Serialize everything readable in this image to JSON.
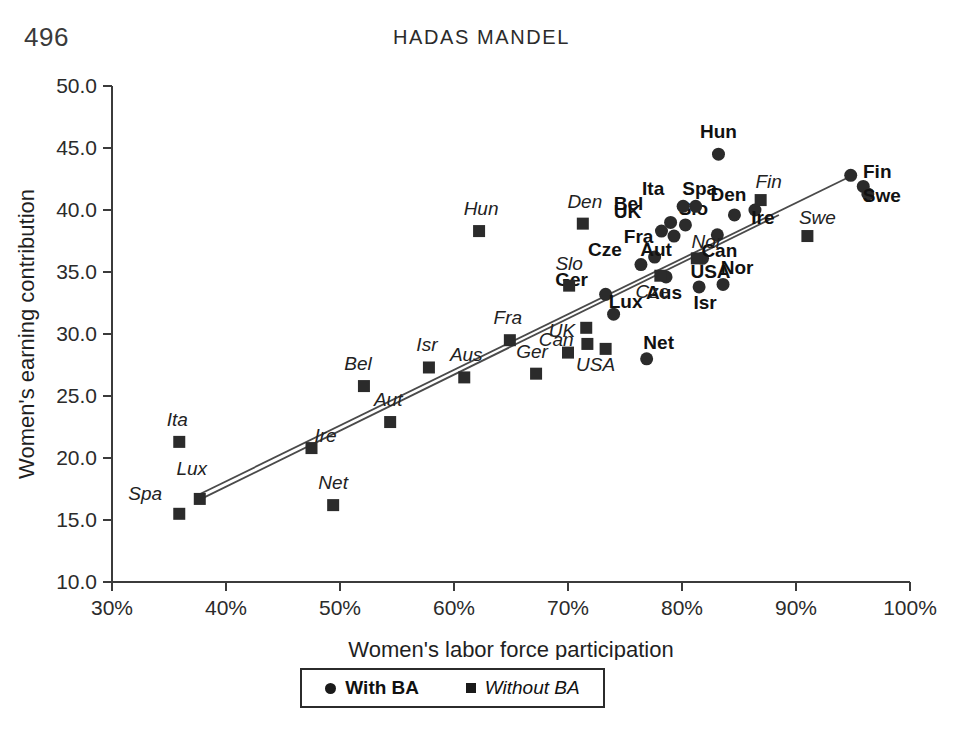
{
  "page": {
    "number": "496",
    "running_head": "HADAS MANDEL"
  },
  "legend": {
    "with_ba": "With BA",
    "without_ba": "Without BA",
    "with_ba_marker": "circle-marker",
    "without_ba_marker": "square-marker"
  },
  "chart_data": {
    "type": "scatter",
    "title": "",
    "xlabel": "Women's labor force participation",
    "ylabel": "Women's earning contribution",
    "xlim": [
      30,
      100
    ],
    "ylim": [
      10.0,
      50.0
    ],
    "xticks": [
      "30%",
      "40%",
      "50%",
      "60%",
      "70%",
      "80%",
      "90%",
      "100%"
    ],
    "xtick_values": [
      30,
      40,
      50,
      60,
      70,
      80,
      90,
      100
    ],
    "yticks": [
      "10.0",
      "15.0",
      "20.0",
      "25.0",
      "30.0",
      "35.0",
      "40.0",
      "45.0",
      "50.0"
    ],
    "ytick_values": [
      10,
      15,
      20,
      25,
      30,
      35,
      40,
      45,
      50
    ],
    "grid": false,
    "legend_position": "bottom-center",
    "series": [
      {
        "name": "With BA",
        "marker": "circle",
        "label_style": "bold",
        "points": [
          {
            "label": "Ger",
            "x": 73.3,
            "y": 33.2,
            "label_dx": -34,
            "label_dy": -8
          },
          {
            "label": "Cze",
            "x": 76.4,
            "y": 35.6,
            "label_dx": -36,
            "label_dy": -9
          },
          {
            "label": "Fra",
            "x": 77.6,
            "y": 36.2,
            "label_dx": -16,
            "label_dy": -14
          },
          {
            "label": "UK",
            "x": 78.2,
            "y": 38.3,
            "label_dx": -34,
            "label_dy": -13
          },
          {
            "label": "Aus",
            "x": 78.6,
            "y": 34.6,
            "label_dx": -2,
            "label_dy": 22
          },
          {
            "label": "Bel",
            "x": 79.0,
            "y": 39.0,
            "label_dx": -42,
            "label_dy": -12
          },
          {
            "label": "Aut",
            "x": 79.3,
            "y": 37.9,
            "label_dx": -18,
            "label_dy": 20
          },
          {
            "label": "Slo",
            "x": 80.3,
            "y": 38.8,
            "label_dx": 8,
            "label_dy": -10
          },
          {
            "label": "Ita",
            "x": 80.1,
            "y": 40.3,
            "label_dx": -30,
            "label_dy": -11
          },
          {
            "label": "Spa",
            "x": 81.2,
            "y": 40.3,
            "label_dx": 4,
            "label_dy": -11
          },
          {
            "label": "Isr",
            "x": 81.5,
            "y": 33.8,
            "label_dx": 6,
            "label_dy": 22
          },
          {
            "label": "USA",
            "x": 81.8,
            "y": 36.1,
            "label_dx": 8,
            "label_dy": 20
          },
          {
            "label": "Can",
            "x": 83.1,
            "y": 38.0,
            "label_dx": 2,
            "label_dy": 22
          },
          {
            "label": "Hun",
            "x": 83.2,
            "y": 44.5,
            "label_dx": 0,
            "label_dy": -16
          },
          {
            "label": "Den",
            "x": 84.6,
            "y": 39.6,
            "label_dx": -6,
            "label_dy": -14
          },
          {
            "label": "Nor",
            "x": 83.6,
            "y": 34.0,
            "label_dx": 14,
            "label_dy": -10
          },
          {
            "label": "Ire",
            "x": 86.4,
            "y": 40.0,
            "label_dx": 8,
            "label_dy": 14
          },
          {
            "label": "Nor2",
            "x": 94.8,
            "y": 42.8,
            "label_dx": 0,
            "label_dy": 0
          },
          {
            "label": "Fin",
            "x": 95.9,
            "y": 41.9,
            "label_dx": 14,
            "label_dy": -8
          },
          {
            "label": "Swe",
            "x": 96.3,
            "y": 41.3,
            "label_dx": 14,
            "label_dy": 8
          },
          {
            "label": "Lux",
            "x": 74.0,
            "y": 31.6,
            "label_dx": 12,
            "label_dy": -6
          },
          {
            "label": "Net",
            "x": 76.9,
            "y": 28.0,
            "label_dx": 12,
            "label_dy": -10
          }
        ]
      },
      {
        "name": "Without BA",
        "marker": "square",
        "label_style": "italic",
        "points": [
          {
            "label": "Ita",
            "x": 35.9,
            "y": 21.3,
            "label_dx": -2,
            "label_dy": -16
          },
          {
            "label": "Spa",
            "x": 35.9,
            "y": 15.5,
            "label_dx": -34,
            "label_dy": -14
          },
          {
            "label": "Lux",
            "x": 37.7,
            "y": 16.7,
            "label_dx": -8,
            "label_dy": -24
          },
          {
            "label": "Ire",
            "x": 47.5,
            "y": 20.8,
            "label_dx": 14,
            "label_dy": -6
          },
          {
            "label": "Net",
            "x": 49.4,
            "y": 16.2,
            "label_dx": 0,
            "label_dy": -16
          },
          {
            "label": "Bel",
            "x": 52.1,
            "y": 25.8,
            "label_dx": -6,
            "label_dy": -16
          },
          {
            "label": "Aut",
            "x": 54.4,
            "y": 22.9,
            "label_dx": -2,
            "label_dy": -16
          },
          {
            "label": "Isr",
            "x": 57.8,
            "y": 27.3,
            "label_dx": -2,
            "label_dy": -16
          },
          {
            "label": "Aus",
            "x": 60.9,
            "y": 26.5,
            "label_dx": 2,
            "label_dy": -16
          },
          {
            "label": "Hun",
            "x": 62.2,
            "y": 38.3,
            "label_dx": 2,
            "label_dy": -16
          },
          {
            "label": "Fra",
            "x": 64.9,
            "y": 29.5,
            "label_dx": -2,
            "label_dy": -16
          },
          {
            "label": "Ger",
            "x": 67.2,
            "y": 26.8,
            "label_dx": -4,
            "label_dy": -16
          },
          {
            "label": "UK",
            "x": 70.0,
            "y": 28.5,
            "label_dx": -6,
            "label_dy": -16
          },
          {
            "label": "Slo",
            "x": 70.1,
            "y": 33.9,
            "label_dx": 0,
            "label_dy": -16
          },
          {
            "label": "Den",
            "x": 71.3,
            "y": 38.9,
            "label_dx": 2,
            "label_dy": -16
          },
          {
            "label": "Can",
            "x": 71.6,
            "y": 30.5,
            "label_dx": -30,
            "label_dy": 18
          },
          {
            "label": "Can2",
            "x": 71.7,
            "y": 29.2,
            "label_dx": 0,
            "label_dy": 0
          },
          {
            "label": "USA",
            "x": 73.3,
            "y": 28.8,
            "label_dx": -10,
            "label_dy": 22
          },
          {
            "label": "Cze",
            "x": 78.1,
            "y": 34.7,
            "label_dx": -8,
            "label_dy": 22
          },
          {
            "label": "Nor",
            "x": 81.3,
            "y": 36.1,
            "label_dx": 10,
            "label_dy": -10
          },
          {
            "label": "Fin",
            "x": 86.9,
            "y": 40.8,
            "label_dx": 8,
            "label_dy": -12
          },
          {
            "label": "Swe",
            "x": 91.0,
            "y": 37.9,
            "label_dx": 10,
            "label_dy": -12
          }
        ]
      }
    ],
    "trend_lines": [
      {
        "name": "with-ba-trendline",
        "x1": 37.5,
        "y1": 17.0,
        "x2": 95.2,
        "y2": 42.9
      },
      {
        "name": "without-ba-trendline",
        "x1": 37.6,
        "y1": 16.6,
        "x2": 88.5,
        "y2": 39.6
      }
    ]
  }
}
